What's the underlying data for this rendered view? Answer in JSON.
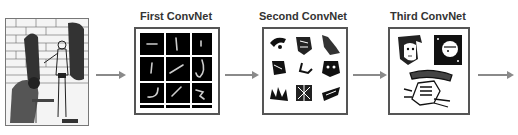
{
  "diagram": {
    "type": "convnet-feature-hierarchy",
    "stages": [
      {
        "id": "input",
        "label": "",
        "description": "Input image: line drawing of two figures in front of a brick wall"
      },
      {
        "id": "first",
        "label": "First ConvNet",
        "description": "3x3 grid of simple edge/stroke features on black background"
      },
      {
        "id": "second",
        "label": "Second ConvNet",
        "description": "3x3 grid of texture/part patches"
      },
      {
        "id": "third",
        "label": "Third ConvNet",
        "description": "Higher-level object parts: faces and a hand"
      }
    ],
    "arrows": [
      {
        "from": "input",
        "to": "first"
      },
      {
        "from": "first",
        "to": "second"
      },
      {
        "from": "second",
        "to": "third"
      },
      {
        "from": "third",
        "to": "output"
      }
    ],
    "colors": {
      "arrow": "#8a8a8a",
      "frame": "#555555",
      "label": "#333333",
      "feature_bg": "#000000"
    }
  }
}
